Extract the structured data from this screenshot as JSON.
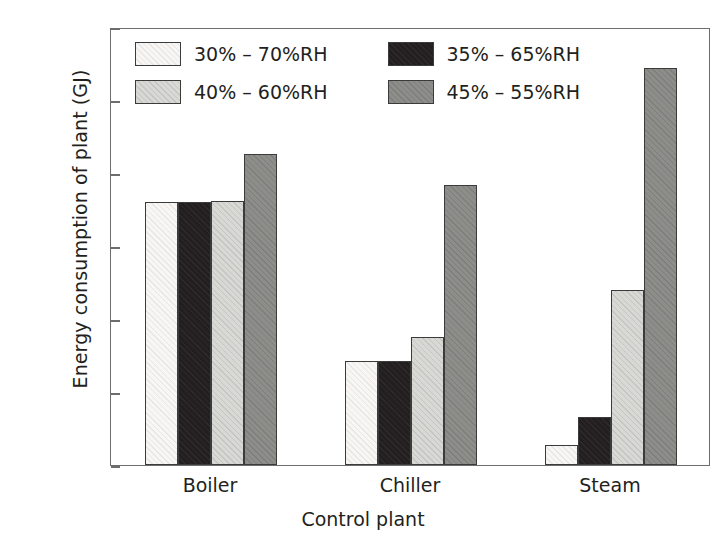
{
  "chart_data": {
    "type": "bar",
    "title": "",
    "xlabel": "Control plant",
    "ylabel": "Energy consumption of plant (GJ)",
    "categories": [
      "Boiler",
      "Chiller",
      "Steam"
    ],
    "ylim": [
      0,
      30
    ],
    "yticks": [
      0,
      5,
      10,
      15,
      20,
      25,
      30
    ],
    "ytick_labels": [
      "0",
      "5",
      "10",
      "15",
      "20",
      "25",
      "30"
    ],
    "grid": false,
    "legend_position": "upper-left-inside",
    "series": [
      {
        "name": "30% – 70%RH",
        "color": "#f7f6f4",
        "values": [
          18.0,
          7.1,
          1.4
        ]
      },
      {
        "name": "35% – 65%RH",
        "color": "#231f20",
        "values": [
          18.0,
          7.1,
          3.3
        ]
      },
      {
        "name": "40% – 60%RH",
        "color": "#d8d8d5",
        "values": [
          18.1,
          8.8,
          12.0
        ]
      },
      {
        "name": "45% – 55%RH",
        "color": "#8d8d8a",
        "values": [
          21.3,
          19.2,
          27.2
        ]
      }
    ]
  },
  "legend": {
    "entries": [
      {
        "label": "30% – 70%RH",
        "swatch": "series-0-swatch"
      },
      {
        "label": "35% – 65%RH",
        "swatch": "series-1-swatch"
      },
      {
        "label": "40% – 60%RH",
        "swatch": "series-2-swatch"
      },
      {
        "label": "45% – 55%RH",
        "swatch": "series-3-swatch"
      }
    ]
  },
  "axes": {
    "y_title": "Energy consumption of plant (GJ)",
    "x_title": "Control plant"
  }
}
